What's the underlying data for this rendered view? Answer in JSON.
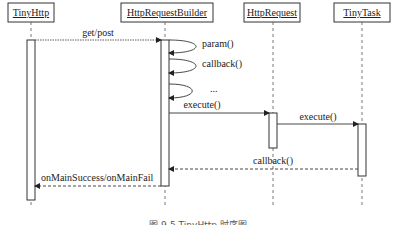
{
  "diagram": {
    "type": "sequence",
    "participants": [
      {
        "id": "tinyhttp",
        "label": "TinyHttp"
      },
      {
        "id": "builder",
        "label": "HttpRequestBuilder"
      },
      {
        "id": "request",
        "label": "HttpRequest"
      },
      {
        "id": "task",
        "label": "TinyTask"
      }
    ],
    "messages": [
      {
        "from": "TinyHttp",
        "to": "HttpRequestBuilder",
        "label": "get/post",
        "style": "solid"
      },
      {
        "from": "HttpRequestBuilder",
        "to": "HttpRequestBuilder",
        "label": "param()",
        "style": "self"
      },
      {
        "from": "HttpRequestBuilder",
        "to": "HttpRequestBuilder",
        "label": "callback()",
        "style": "self"
      },
      {
        "from": "HttpRequestBuilder",
        "to": "HttpRequestBuilder",
        "label": "...",
        "style": "self"
      },
      {
        "from": "HttpRequestBuilder",
        "to": "HttpRequest",
        "label": "execute()",
        "style": "solid"
      },
      {
        "from": "HttpRequest",
        "to": "TinyTask",
        "label": "execute()",
        "style": "solid"
      },
      {
        "from": "TinyTask",
        "to": "HttpRequestBuilder",
        "label": "callback()",
        "style": "dashed"
      },
      {
        "from": "HttpRequestBuilder",
        "to": "TinyHttp",
        "label": "onMainSuccess/onMainFail",
        "style": "dashed"
      }
    ],
    "caption": "图 9-5  TinyHttp 时序图"
  }
}
